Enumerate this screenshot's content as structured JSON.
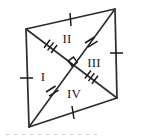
{
  "figure": {
    "shape_name": "rhombus",
    "stroke_color": "#2b2b2b",
    "label_color": "#1b1b1b",
    "background_color": "#ffffff",
    "vertices": {
      "top_right": {
        "x": 115,
        "y": 9
      },
      "right": {
        "x": 117,
        "y": 98
      },
      "bottom_left": {
        "x": 29,
        "y": 127
      },
      "left": {
        "x": 26,
        "y": 29
      },
      "center": {
        "x": 71.75,
        "y": 65.75
      }
    },
    "region_labels": [
      {
        "text": "I",
        "x": 43,
        "y": 78
      },
      {
        "text": "II",
        "x": 67,
        "y": 40
      },
      {
        "text": "III",
        "x": 94,
        "y": 64
      },
      {
        "text": "IV",
        "x": 74,
        "y": 95
      }
    ],
    "side_tick_marks": [
      {
        "name": "top-side-tick",
        "count": 1,
        "x": 70,
        "y": 19
      },
      {
        "name": "right-side-tick",
        "count": 1,
        "x": 116,
        "y": 53
      },
      {
        "name": "bottom-side-tick",
        "count": 1,
        "x": 73,
        "y": 112
      },
      {
        "name": "left-side-tick",
        "count": 1,
        "x": 27,
        "y": 78
      }
    ],
    "diagonal_tick_marks": [
      {
        "name": "upper-left-diagonal-tick",
        "count": 3,
        "x": 49,
        "y": 47
      },
      {
        "name": "lower-right-diagonal-tick",
        "count": 3,
        "x": 95,
        "y": 82
      },
      {
        "name": "upper-right-diagonal-tick",
        "count": 2,
        "x": 93,
        "y": 37
      },
      {
        "name": "lower-left-diagonal-tick",
        "count": 2,
        "x": 51,
        "y": 94
      }
    ],
    "right_angle_marker": {
      "x": 71.75,
      "y": 65.75,
      "size": 8
    },
    "caption": ""
  }
}
